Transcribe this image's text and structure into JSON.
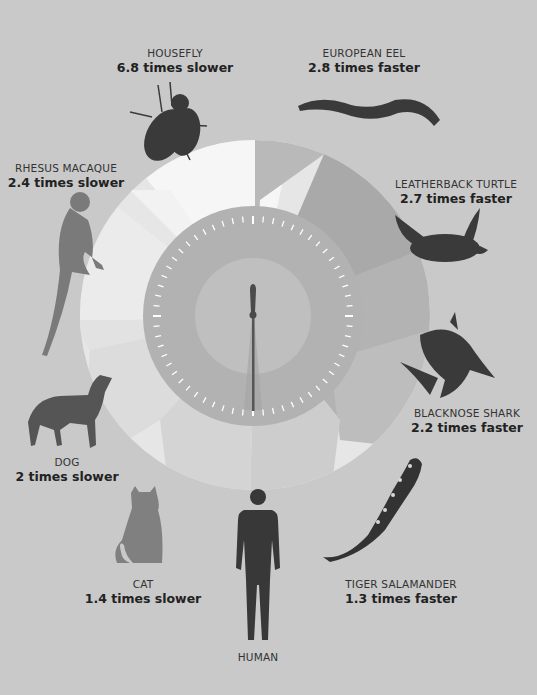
{
  "colors": {
    "background": "#c9c9c9",
    "wheel_white": "#f4f4f4",
    "wheel_light": "#e0e0e0",
    "wheel_mid": "#b5b5b5",
    "wheel_dark": "#a6a6a6",
    "dial_outer": "#b0b0b0",
    "dial_inner": "#bdbdbd",
    "silhouette_dark": "#3a3a3a",
    "silhouette_gray": "#7e7e7e",
    "tick": "#ffffff",
    "hand": "#4a4a4a"
  },
  "clock": {
    "center_label": "",
    "hand_position": "12 / 6"
  },
  "animals": [
    {
      "id": "housefly",
      "name": "HOUSEFLY",
      "rate": "6.8 times slower",
      "x": 175,
      "y": 78
    },
    {
      "id": "european-eel",
      "name": "EUROPEAN EEL",
      "rate": "2.8 times faster",
      "x": 364,
      "y": 78
    },
    {
      "id": "rhesus-macaque",
      "name": "RHESUS MACAQUE",
      "rate": "2.4 times slower",
      "x": 66,
      "y": 160
    },
    {
      "id": "leatherback-turtle",
      "name": "LEATHERBACK TURTLE",
      "rate": "2.7 times faster",
      "x": 456,
      "y": 177
    },
    {
      "id": "blacknose-shark",
      "name": "BLACKNOSE SHARK",
      "rate": "2.2 times faster",
      "x": 467,
      "y": 405
    },
    {
      "id": "dog",
      "name": "DOG",
      "rate": "2 times slower",
      "x": 67,
      "y": 453
    },
    {
      "id": "cat",
      "name": "CAT",
      "rate": "1.4 times slower",
      "x": 144,
      "y": 577
    },
    {
      "id": "tiger-salamander",
      "name": "TIGER SALAMANDER",
      "rate": "1.3 times faster",
      "x": 401,
      "y": 577
    },
    {
      "id": "human",
      "name": "HUMAN",
      "rate": "",
      "x": 258,
      "y": 650
    }
  ]
}
